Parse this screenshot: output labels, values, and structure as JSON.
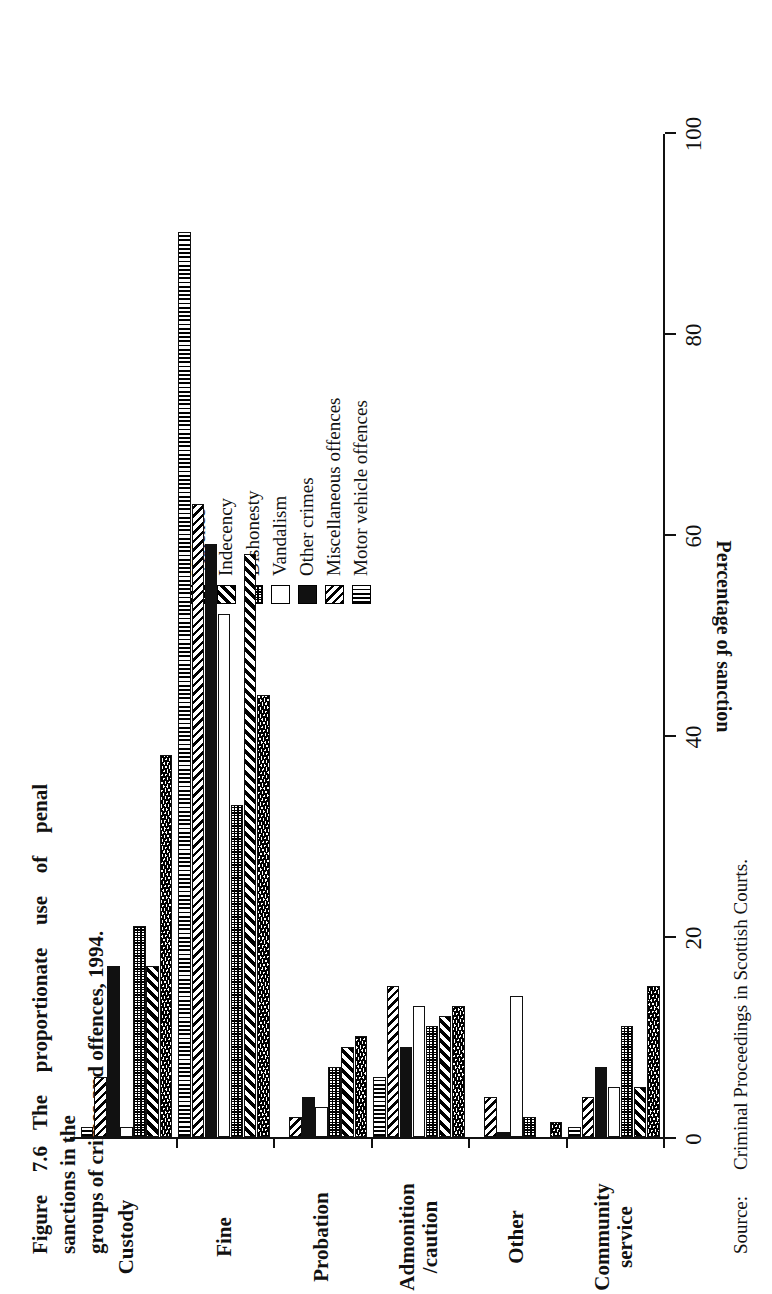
{
  "title": {
    "number": "Figure 7.6",
    "line1": "The  proportionate  use  of  penal  sanctions  in  the",
    "line2": "groups of crimes and offences, 1994."
  },
  "source": {
    "label": "Source:",
    "text": "Criminal Proceedings in Scottish Courts."
  },
  "axis": {
    "value_title": "Percentage of sanction",
    "ticks": [
      "0",
      "20",
      "40",
      "60",
      "80",
      "100"
    ]
  },
  "legend": {
    "items": [
      {
        "label": "Violence",
        "pattern": "pat-violence"
      },
      {
        "label": "Indecency",
        "pattern": "pat-indecency"
      },
      {
        "label": "Dishonesty",
        "pattern": "pat-dishonesty"
      },
      {
        "label": "Vandalism",
        "pattern": "pat-vandalism"
      },
      {
        "label": "Other crimes",
        "pattern": "pat-other"
      },
      {
        "label": "Miscellaneous offences",
        "pattern": "pat-misc"
      },
      {
        "label": "Motor vehicle offences",
        "pattern": "pat-motor"
      }
    ]
  },
  "chart_data": {
    "type": "bar",
    "orientation": "vertical",
    "title": "The proportionate use of penal sanctions in the groups of crimes and offences, 1994.",
    "xlabel": "",
    "ylabel": "Percentage of sanction",
    "ylim": [
      0,
      100
    ],
    "yticks": [
      0,
      20,
      40,
      60,
      80,
      100
    ],
    "grid": false,
    "legend_position": "upper-right",
    "categories": [
      "Custody",
      "Fine",
      "Probation",
      "Admonition\n/caution",
      "Other",
      "Community\nservice"
    ],
    "series": [
      {
        "name": "Violence",
        "pattern": "pat-violence",
        "values": [
          38,
          44,
          10,
          13,
          1.5,
          15
        ]
      },
      {
        "name": "Indecency",
        "pattern": "pat-indecency",
        "values": [
          17,
          58,
          9,
          12,
          0,
          5
        ]
      },
      {
        "name": "Dishonesty",
        "pattern": "pat-dishonesty",
        "values": [
          21,
          33,
          7,
          11,
          2,
          11
        ]
      },
      {
        "name": "Vandalism",
        "pattern": "pat-vandalism",
        "values": [
          1,
          52,
          3,
          13,
          14,
          5
        ]
      },
      {
        "name": "Other crimes",
        "pattern": "pat-other",
        "values": [
          17,
          59,
          4,
          9,
          0.5,
          7
        ]
      },
      {
        "name": "Miscellaneous offences",
        "pattern": "pat-misc",
        "values": [
          6,
          63,
          2,
          15,
          4,
          4
        ]
      },
      {
        "name": "Motor vehicle offences",
        "pattern": "pat-motor",
        "values": [
          1,
          90,
          0,
          6,
          0,
          1
        ]
      }
    ]
  }
}
